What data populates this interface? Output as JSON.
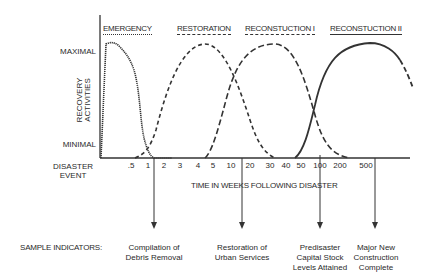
{
  "y_axis": {
    "title_line1": "RECOVERY",
    "title_line2": "ACTIVITIES",
    "max_label": "MAXIMAL",
    "min_label": "MINIMAL"
  },
  "x_axis": {
    "origin_line1": "DISASTER",
    "origin_line2": "EVENT",
    "title": "TIME IN WEEKS FOLLOWING DISASTER",
    "ticks": [
      ".5",
      "1",
      "2",
      "3",
      "4",
      "5",
      "10",
      "20",
      "30",
      "40",
      "50",
      "100",
      "200",
      "500"
    ]
  },
  "phases": [
    {
      "label": "EMERGENCY",
      "line_style": "dotted"
    },
    {
      "label": "RESTORATION",
      "line_style": "dashed"
    },
    {
      "label": "RECONSTUCTION I",
      "line_style": "long-dashed"
    },
    {
      "label": "RECONSTUCTION II",
      "line_style": "solid"
    }
  ],
  "indicators": {
    "title": "SAMPLE INDICATORS:",
    "items": [
      {
        "line1": "Compilation of",
        "line2": "Debris Removal",
        "line3": ""
      },
      {
        "line1": "Restoration of",
        "line2": "Urban Services",
        "line3": ""
      },
      {
        "line1": "Predisaster",
        "line2": "Capital Stock",
        "line3": "Levels Attained"
      },
      {
        "line1": "Major New",
        "line2": "Construction",
        "line3": "Complete"
      }
    ]
  }
}
